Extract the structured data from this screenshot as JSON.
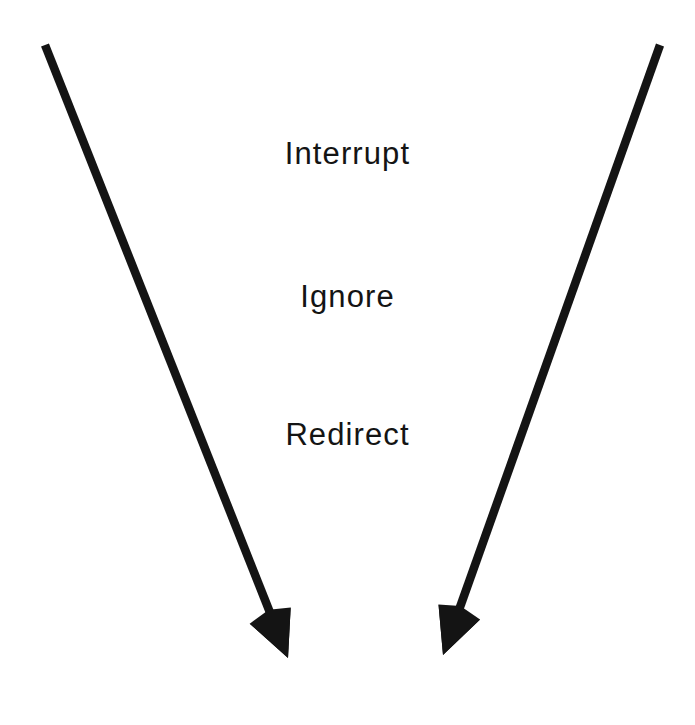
{
  "figure": {
    "background_color": "#ffffff",
    "ink_color": "#141414",
    "width": 695,
    "height": 725
  },
  "labels": [
    {
      "id": "interrupt",
      "text": "Interrupt"
    },
    {
      "id": "ignore",
      "text": "Ignore"
    },
    {
      "id": "redirect",
      "text": "Redirect"
    }
  ],
  "arrows": [
    {
      "id": "left-arrow",
      "direction": "down-right",
      "color": "#141414",
      "stroke_width": 8.5,
      "tail": {
        "x": 45,
        "y": 45
      },
      "tip": {
        "x": 288,
        "y": 658
      }
    },
    {
      "id": "right-arrow",
      "direction": "down-left",
      "color": "#141414",
      "stroke_width": 8.5,
      "tail": {
        "x": 660,
        "y": 45
      },
      "tip": {
        "x": 443,
        "y": 655
      }
    }
  ],
  "chart_data": {
    "type": "diagram",
    "title": "",
    "shape": "converging-v",
    "annotations": [
      "Interrupt",
      "Ignore",
      "Redirect"
    ]
  }
}
